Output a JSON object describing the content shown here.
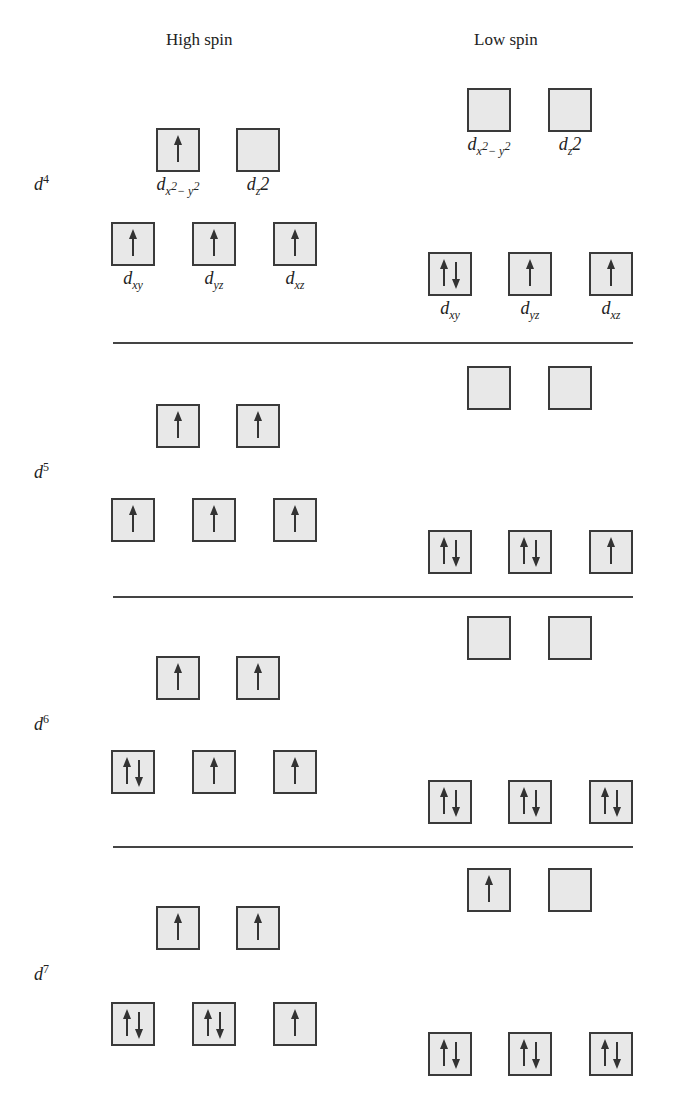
{
  "headers": {
    "high_spin": "High spin",
    "low_spin": "Low spin"
  },
  "orbital_labels": {
    "dx2y2": [
      "d",
      "x",
      "2",
      "− y",
      "2"
    ],
    "dz2": [
      "d",
      "z",
      "2"
    ],
    "dxy": [
      "d",
      "xy"
    ],
    "dyz": [
      "d",
      "yz"
    ],
    "dxz": [
      "d",
      "xz"
    ]
  },
  "configs": [
    {
      "name": "d",
      "sup": "4",
      "high": {
        "eg": [
          "up",
          "empty"
        ],
        "t2g": [
          "up",
          "up",
          "up"
        ]
      },
      "low": {
        "eg": [
          "empty",
          "empty"
        ],
        "t2g": [
          "pair",
          "up",
          "up"
        ]
      }
    },
    {
      "name": "d",
      "sup": "5",
      "high": {
        "eg": [
          "up",
          "up"
        ],
        "t2g": [
          "up",
          "up",
          "up"
        ]
      },
      "low": {
        "eg": [
          "empty",
          "empty"
        ],
        "t2g": [
          "pair",
          "pair",
          "up"
        ]
      }
    },
    {
      "name": "d",
      "sup": "6",
      "high": {
        "eg": [
          "up",
          "up"
        ],
        "t2g": [
          "pair",
          "up",
          "up"
        ]
      },
      "low": {
        "eg": [
          "empty",
          "empty"
        ],
        "t2g": [
          "pair",
          "pair",
          "pair"
        ]
      }
    },
    {
      "name": "d",
      "sup": "7",
      "high": {
        "eg": [
          "up",
          "up"
        ],
        "t2g": [
          "pair",
          "pair",
          "up"
        ]
      },
      "low": {
        "eg": [
          "up",
          "empty"
        ],
        "t2g": [
          "pair",
          "pair",
          "pair"
        ]
      }
    }
  ],
  "colors": {
    "box_fill": "#e8e8e8",
    "box_border": "#3a3a3a",
    "arrow": "#333333",
    "rule": "#444444"
  }
}
